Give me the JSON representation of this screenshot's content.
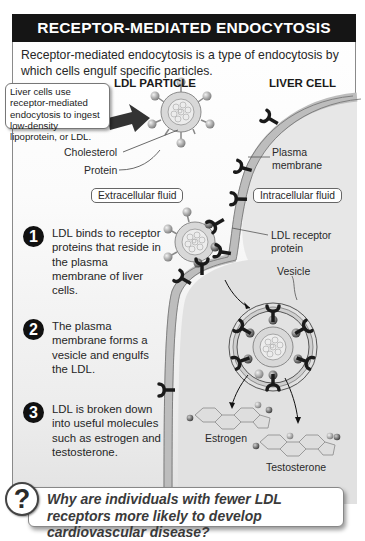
{
  "header": {
    "title": "RECEPTOR-MEDIATED ENDOCYTOSIS"
  },
  "intro": "Receptor-mediated endocytosis is a type of endocytosis by which cells engulf specific particles.",
  "callout": "Liver cells use receptor-mediated endocytosis to ingest low-density lipoprotein, or LDL.",
  "columns": {
    "left": "LDL PARTICLE",
    "right": "LIVER CELL"
  },
  "labels": {
    "cholesterol": "Cholesterol",
    "protein": "Protein",
    "plasma_membrane_1": "Plasma",
    "plasma_membrane_2": "membrane",
    "extracellular": "Extracellular fluid",
    "intracellular": "Intracellular fluid",
    "ldl_receptor_1": "LDL receptor",
    "ldl_receptor_2": "protein",
    "vesicle": "Vesicle",
    "estrogen": "Estrogen",
    "testosterone": "Testosterone"
  },
  "steps": [
    {
      "number": "1",
      "text": "LDL binds to receptor proteins that reside in the plasma membrane of liver cells."
    },
    {
      "number": "2",
      "text": "The plasma membrane forms a vesicle and engulfs the LDL."
    },
    {
      "number": "3",
      "text": "LDL is broken down into useful molecules such as estrogen and testosterone."
    }
  ],
  "question": {
    "icon": "?",
    "text": "Why are individuals with fewer LDL receptors more likely to develop cardiovascular disease?"
  },
  "colors": {
    "header_bg": "#151515",
    "membrane": "#bdbdbd",
    "receptor": "#1a1a1a"
  }
}
